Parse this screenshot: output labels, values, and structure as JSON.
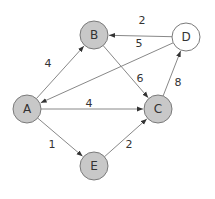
{
  "diagram": {
    "type": "directed-weighted-graph",
    "colors": {
      "node_fill_default": "#c8c8c8",
      "node_fill_highlight": "#ffffff",
      "node_stroke": "#7a7a7a",
      "edge_stroke": "#888888",
      "arrowhead": "#333333",
      "text": "#333333"
    },
    "nodes": [
      {
        "id": "A",
        "label": "A",
        "x": 27,
        "y": 109,
        "r": 14,
        "fill": "#c8c8c8"
      },
      {
        "id": "B",
        "label": "B",
        "x": 94,
        "y": 35,
        "r": 14,
        "fill": "#c8c8c8"
      },
      {
        "id": "C",
        "label": "C",
        "x": 158,
        "y": 109,
        "r": 14,
        "fill": "#c8c8c8"
      },
      {
        "id": "D",
        "label": "D",
        "x": 186,
        "y": 37,
        "r": 14,
        "fill": "#ffffff"
      },
      {
        "id": "E",
        "label": "E",
        "x": 94,
        "y": 166,
        "r": 14,
        "fill": "#c8c8c8"
      }
    ],
    "edges": [
      {
        "from": "A",
        "to": "B",
        "weight": "4",
        "label_x": 48,
        "label_y": 63
      },
      {
        "from": "D",
        "to": "B",
        "weight": "2",
        "label_x": 142,
        "label_y": 20
      },
      {
        "from": "D",
        "to": "A",
        "weight": "5",
        "label_x": 139,
        "label_y": 43
      },
      {
        "from": "B",
        "to": "C",
        "weight": "6",
        "label_x": 140,
        "label_y": 78
      },
      {
        "from": "C",
        "to": "D",
        "weight": "8",
        "label_x": 178,
        "label_y": 82
      },
      {
        "from": "A",
        "to": "C",
        "weight": "4",
        "label_x": 89,
        "label_y": 103
      },
      {
        "from": "A",
        "to": "E",
        "weight": "1",
        "label_x": 52,
        "label_y": 144
      },
      {
        "from": "E",
        "to": "C",
        "weight": "2",
        "label_x": 129,
        "label_y": 144
      }
    ]
  }
}
